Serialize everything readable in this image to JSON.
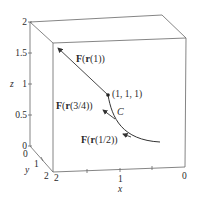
{
  "diagram": {
    "type": "3d-vector-field-along-curve",
    "axes": {
      "z": {
        "label": "z",
        "ticks": [
          "0",
          "0.5",
          "1",
          "1.5",
          "2"
        ]
      },
      "y": {
        "label": "y",
        "ticks": [
          "0",
          "1",
          "2"
        ]
      },
      "x": {
        "label": "x",
        "ticks": [
          "2",
          "1",
          "0"
        ]
      }
    },
    "curve": {
      "label": "C"
    },
    "point": {
      "label": "(1, 1, 1)"
    },
    "vectors": [
      {
        "label_prefix": "F(",
        "label_bold_r": "r",
        "label_arg": "(1))",
        "full": "F(r(1))"
      },
      {
        "label_prefix": "F(",
        "label_bold_r": "r",
        "label_arg": "(3/4))",
        "full": "F(r(3/4))"
      },
      {
        "label_prefix": "F(",
        "label_bold_r": "r",
        "label_arg": "(1/2))",
        "full": "F(r(1/2))"
      }
    ],
    "colors": {
      "line": "#555555",
      "curve": "#333333",
      "text": "#2a2a2a"
    }
  }
}
